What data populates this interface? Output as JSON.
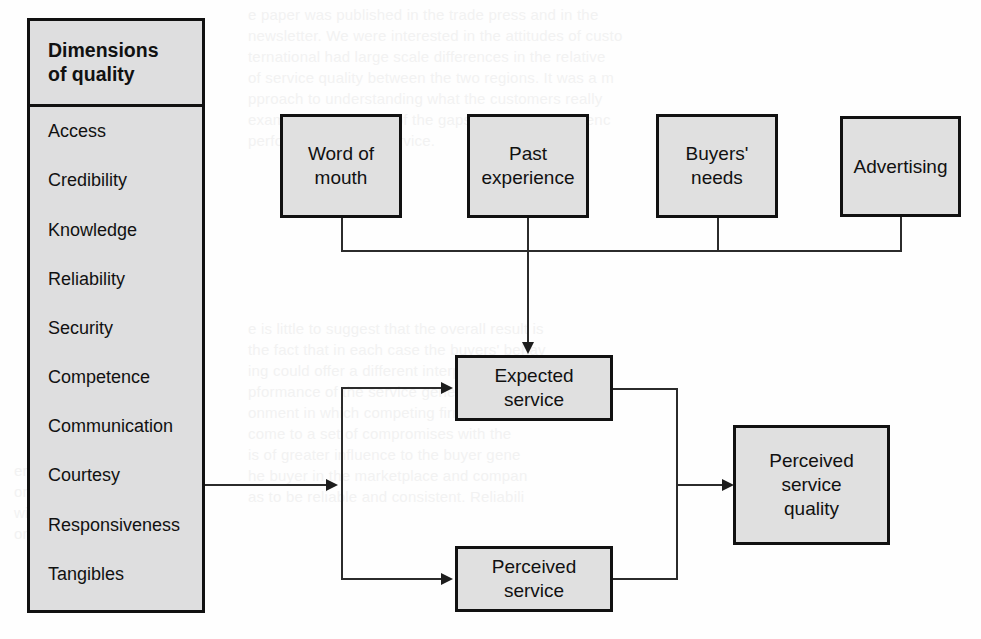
{
  "diagram": {
    "canvas": {
      "width": 981,
      "height": 639
    },
    "colors": {
      "box_fill": "#e0e0e0",
      "panel_fill": "#dededf",
      "border": "#111111",
      "line": "#2b2b2b",
      "background": "#fefefe",
      "text": "#111111"
    }
  },
  "panel": {
    "header": "Dimensions\nof quality",
    "items": [
      {
        "label": "Access"
      },
      {
        "label": "Credibility"
      },
      {
        "label": "Knowledge"
      },
      {
        "label": "Reliability"
      },
      {
        "label": "Security"
      },
      {
        "label": "Competence"
      },
      {
        "label": "Communication"
      },
      {
        "label": "Courtesy"
      },
      {
        "label": "Responsiveness"
      },
      {
        "label": "Tangibles"
      }
    ]
  },
  "nodes": {
    "word_of_mouth": "Word of\nmouth",
    "past_experience": "Past\nexperience",
    "buyers_needs": "Buyers'\nneeds",
    "advertising": "Advertising",
    "expected_service": "Expected\nservice",
    "perceived_service": "Perceived\nservice",
    "perceived_service_quality": "Perceived\nservice\nquality"
  },
  "ghost_text": {
    "top_right_block": "e paper was published in the trade press and in the\nnewsletter. We were interested in the attitudes of custo\nternational had large scale differences in the relative\nof service quality between the two regions. It was a m\npproach to understanding what the customers really\nexamining the extent of the gaps, that is the differenc\nperformance of the service.",
    "mid_right_block": "e is little to suggest that the overall result is\nthe fact that in each case the buyers' behav\ning could offer a different interpretation of th\npformance of the service generally. The\nonment in which competing firms can m\ncome to a set of compromises with the\nis of greater influence to the buyer gene\nhe buyer in the marketplace and compan\nas to be reliable and consistent. Reliabili",
    "left_block": "er the\nomething\nwith a\nons."
  }
}
